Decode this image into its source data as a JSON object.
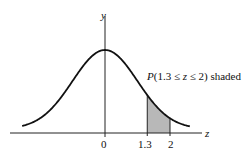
{
  "figure": {
    "title_annotation": "P(1.3 ≤ z ≤ 2) shaded",
    "annotation_parts": {
      "p": "P",
      "rest": "(1.3 ≤ ",
      "z": "z",
      "tail": " ≤ 2) shaded"
    },
    "x_axis_label": "z",
    "y_axis_label": "y",
    "ticks": [
      {
        "label": "0",
        "value": 0
      },
      {
        "label": "1.3",
        "value": 1.3
      },
      {
        "label": "2",
        "value": 2
      }
    ],
    "shaded_region": {
      "from": 1.3,
      "to": 2,
      "color": "#b8b8b8"
    },
    "curve": "standard normal density"
  }
}
